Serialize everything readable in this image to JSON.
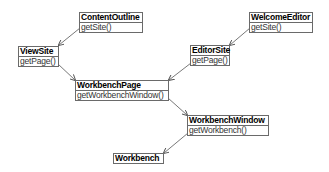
{
  "diagram": {
    "type": "class-association",
    "boxes": [
      {
        "id": "contentoutline",
        "title": "ContentOutline",
        "method": "getSite()"
      },
      {
        "id": "welcomeeditor",
        "title": "WelcomeEditor",
        "method": "getSite()"
      },
      {
        "id": "viewsite",
        "title": "ViewSite",
        "method": "getPage()"
      },
      {
        "id": "editorsite",
        "title": "EditorSite",
        "method": "getPage()"
      },
      {
        "id": "workbenchpage",
        "title": "WorkbenchPage",
        "method": "getWorkbenchWindow()"
      },
      {
        "id": "workbenchwindow",
        "title": "WorkbenchWindow",
        "method": "getWorkbench()"
      },
      {
        "id": "workbench",
        "title": "Workbench"
      }
    ],
    "edges": [
      {
        "from": "ContentOutline",
        "to": "ViewSite"
      },
      {
        "from": "WelcomeEditor",
        "to": "EditorSite"
      },
      {
        "from": "ViewSite",
        "to": "WorkbenchPage"
      },
      {
        "from": "EditorSite",
        "to": "WorkbenchPage"
      },
      {
        "from": "WorkbenchPage",
        "to": "WorkbenchWindow"
      },
      {
        "from": "WorkbenchWindow",
        "to": "Workbench"
      }
    ],
    "colors": {
      "border": "#6a6a6a",
      "arrow": "#555555",
      "title": "#000000",
      "method": "#333333"
    }
  }
}
